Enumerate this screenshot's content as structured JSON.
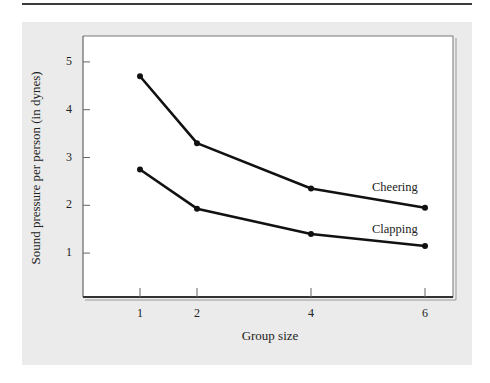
{
  "chart_data": {
    "type": "line",
    "title": "",
    "xlabel": "Group size",
    "ylabel": "Sound pressure per person (in dynes)",
    "x": [
      1,
      2,
      4,
      6
    ],
    "x_ticks": [
      "1",
      "2",
      "4",
      "6"
    ],
    "y_ticks": [
      "1",
      "2",
      "3",
      "4",
      "5"
    ],
    "ylim": [
      0,
      5.5
    ],
    "xlim": [
      0,
      6.5
    ],
    "grid": false,
    "legend": "inline labels at line ends",
    "series": [
      {
        "name": "Cheering",
        "values": [
          4.7,
          3.3,
          2.35,
          1.95
        ]
      },
      {
        "name": "Clapping",
        "values": [
          2.75,
          1.93,
          1.4,
          1.15
        ]
      }
    ]
  },
  "colors": {
    "panel_background": "#ebebeb",
    "plot_background": "#ffffff",
    "line": "#111111",
    "frame": "#555555"
  }
}
